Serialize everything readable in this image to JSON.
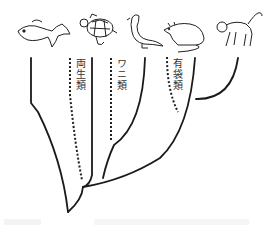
{
  "diagram": {
    "type": "phylogenetic-tree",
    "animals": [
      {
        "name": "fish",
        "x": 32
      },
      {
        "name": "turtle",
        "x": 95
      },
      {
        "name": "bird",
        "x": 145
      },
      {
        "name": "rat",
        "x": 185
      },
      {
        "name": "monkey",
        "x": 236
      }
    ],
    "labels": {
      "amphibians": "両生類",
      "crocodiles": "ワニ類",
      "marsupials": "有袋類"
    },
    "line_color": "#1a1a1a",
    "dotted_line_color": "#222222"
  }
}
